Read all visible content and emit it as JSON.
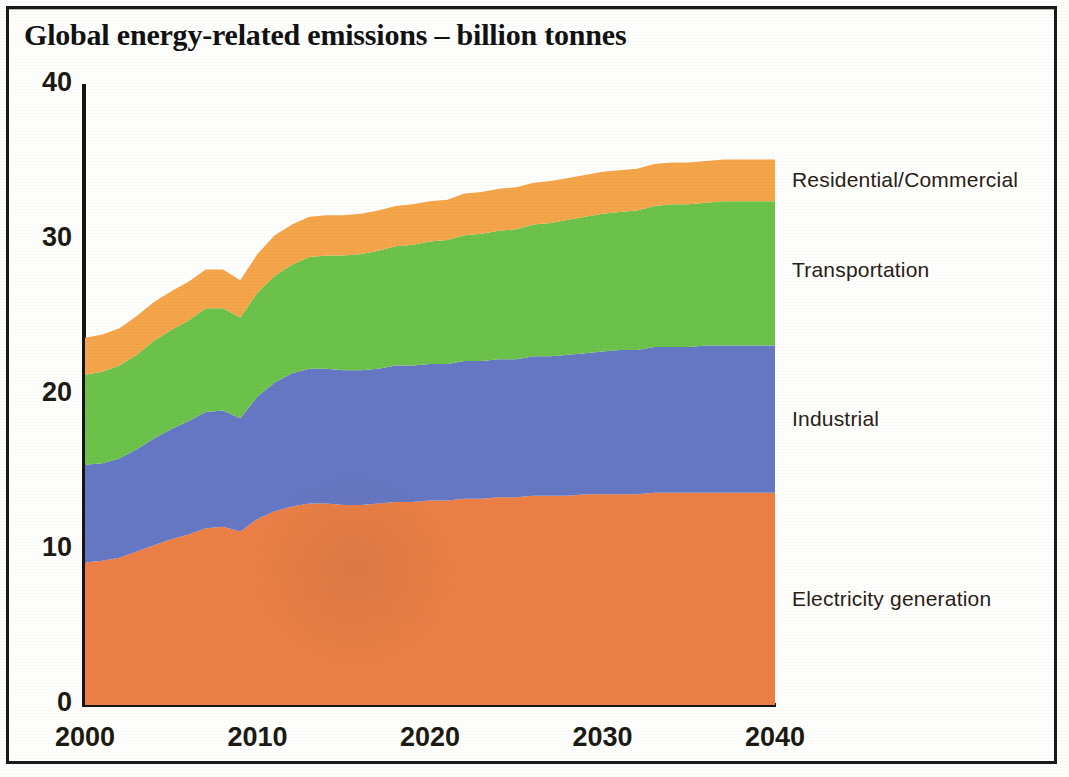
{
  "figure": {
    "title": "Global energy-related emissions – billion tonnes"
  },
  "axes": {
    "y_ticks": [
      "0",
      "10",
      "20",
      "30",
      "40"
    ],
    "x_ticks": [
      "2000",
      "2010",
      "2020",
      "2030",
      "2040"
    ]
  },
  "series_labels": {
    "residential_commercial": "Residential/Commercial",
    "transportation": "Transportation",
    "industrial": "Industrial",
    "electricity_generation": "Electricity generation"
  },
  "colors": {
    "electricity_generation": "#EC7F46",
    "industrial": "#6678C4",
    "transportation": "#6CC24A",
    "residential_commercial": "#F5A54A",
    "axis": "#16160F",
    "text": "#1D1A13"
  },
  "chart_data": {
    "type": "area",
    "title": "Global energy-related emissions – billion tonnes",
    "subtitle": "",
    "xlabel": "",
    "ylabel": "billion tonnes",
    "stacked": true,
    "grid": false,
    "legend_position": "right-inline",
    "xlim": [
      2000,
      2040
    ],
    "ylim": [
      0,
      40
    ],
    "x_tick_values": [
      2000,
      2010,
      2020,
      2030,
      2040
    ],
    "y_tick_values": [
      0,
      10,
      20,
      30,
      40
    ],
    "x": [
      2000,
      2001,
      2002,
      2003,
      2004,
      2005,
      2006,
      2007,
      2008,
      2009,
      2010,
      2011,
      2012,
      2013,
      2014,
      2015,
      2016,
      2017,
      2018,
      2019,
      2020,
      2021,
      2022,
      2023,
      2024,
      2025,
      2026,
      2027,
      2028,
      2029,
      2030,
      2031,
      2032,
      2033,
      2034,
      2035,
      2036,
      2037,
      2038,
      2039,
      2040
    ],
    "series": [
      {
        "name": "Electricity generation",
        "color": "#EC7F46",
        "values": [
          9.2,
          9.3,
          9.5,
          9.9,
          10.3,
          10.7,
          11.0,
          11.4,
          11.5,
          11.2,
          12.0,
          12.5,
          12.8,
          13.0,
          13.0,
          12.9,
          12.9,
          13.0,
          13.1,
          13.1,
          13.2,
          13.2,
          13.3,
          13.3,
          13.4,
          13.4,
          13.5,
          13.5,
          13.5,
          13.6,
          13.6,
          13.6,
          13.6,
          13.7,
          13.7,
          13.7,
          13.7,
          13.7,
          13.7,
          13.7,
          13.7
        ]
      },
      {
        "name": "Industrial",
        "color": "#6678C4",
        "values": [
          6.3,
          6.3,
          6.4,
          6.6,
          6.9,
          7.1,
          7.3,
          7.5,
          7.5,
          7.3,
          7.9,
          8.3,
          8.6,
          8.7,
          8.7,
          8.7,
          8.7,
          8.7,
          8.8,
          8.8,
          8.8,
          8.8,
          8.9,
          8.9,
          8.9,
          8.9,
          9.0,
          9.0,
          9.1,
          9.1,
          9.2,
          9.3,
          9.3,
          9.4,
          9.4,
          9.4,
          9.5,
          9.5,
          9.5,
          9.5,
          9.5
        ]
      },
      {
        "name": "Transportation",
        "color": "#6CC24A",
        "values": [
          5.8,
          5.9,
          6.0,
          6.1,
          6.3,
          6.4,
          6.5,
          6.7,
          6.6,
          6.5,
          6.7,
          6.9,
          7.0,
          7.2,
          7.3,
          7.4,
          7.5,
          7.6,
          7.7,
          7.8,
          7.9,
          8.0,
          8.1,
          8.2,
          8.3,
          8.4,
          8.5,
          8.6,
          8.7,
          8.8,
          8.9,
          8.9,
          9.0,
          9.1,
          9.2,
          9.2,
          9.2,
          9.3,
          9.3,
          9.3,
          9.3
        ]
      },
      {
        "name": "Residential/Commercial",
        "color": "#F5A54A",
        "values": [
          2.4,
          2.4,
          2.4,
          2.5,
          2.5,
          2.5,
          2.5,
          2.5,
          2.5,
          2.4,
          2.5,
          2.6,
          2.6,
          2.6,
          2.6,
          2.6,
          2.6,
          2.6,
          2.6,
          2.6,
          2.6,
          2.6,
          2.7,
          2.7,
          2.7,
          2.7,
          2.7,
          2.7,
          2.7,
          2.7,
          2.7,
          2.7,
          2.7,
          2.7,
          2.7,
          2.7,
          2.7,
          2.7,
          2.7,
          2.7,
          2.7
        ]
      }
    ],
    "stack_totals": [
      23.7,
      23.9,
      24.3,
      25.1,
      26.0,
      26.7,
      27.3,
      28.1,
      28.1,
      27.4,
      29.1,
      30.3,
      31.0,
      31.5,
      31.6,
      31.6,
      31.7,
      31.9,
      32.2,
      32.3,
      32.5,
      32.6,
      33.0,
      33.1,
      33.3,
      33.4,
      33.7,
      33.8,
      34.0,
      34.2,
      34.4,
      34.5,
      34.6,
      34.9,
      35.0,
      35.0,
      35.1,
      35.2,
      35.2,
      35.2,
      35.2
    ],
    "annotations": [
      {
        "text": "Residential/Commercial",
        "x": 2040,
        "y": 33.8
      },
      {
        "text": "Transportation",
        "x": 2040,
        "y": 28.0
      },
      {
        "text": "Industrial",
        "x": 2040,
        "y": 18.4
      },
      {
        "text": "Electricity generation",
        "x": 2040,
        "y": 6.8
      }
    ]
  }
}
